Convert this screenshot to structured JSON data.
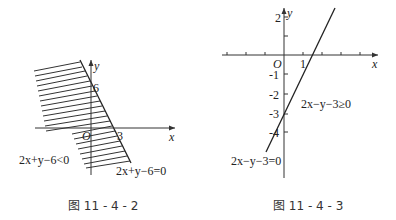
{
  "figures": [
    {
      "caption": "图 11 - 4 - 2",
      "x_axis_label": "x",
      "y_axis_label": "y",
      "origin_label": "O",
      "y_intercept_label": "6",
      "x_intercept_label": "3",
      "region_label": "2x+y−6<0",
      "line_label": "2x+y−6=0",
      "line_equation": "2x+y-6=0",
      "shaded_region": "2x+y-6<0",
      "line_color": "#222222"
    },
    {
      "caption": "图 11 - 4 - 3",
      "x_axis_label": "x",
      "y_axis_label": "y",
      "origin_label": "O",
      "x_tick_labels": [
        "1"
      ],
      "y_tick_labels": [
        "2",
        "-1",
        "-2",
        "-3",
        "-4"
      ],
      "region_label": "2x−y−3≥0",
      "line_label": "2x−y−3=0",
      "line_equation": "2x-y-3=0",
      "line_color": "#222222"
    }
  ]
}
